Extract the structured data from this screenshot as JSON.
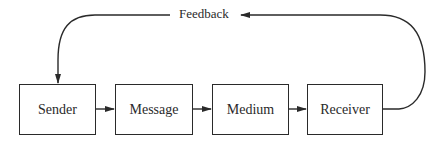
{
  "diagram": {
    "type": "communication-process-flow",
    "nodes": [
      {
        "id": "sender",
        "label": "Sender"
      },
      {
        "id": "message",
        "label": "Message"
      },
      {
        "id": "medium",
        "label": "Medium"
      },
      {
        "id": "receiver",
        "label": "Receiver"
      }
    ],
    "edges": [
      {
        "from": "sender",
        "to": "message"
      },
      {
        "from": "message",
        "to": "medium"
      },
      {
        "from": "medium",
        "to": "receiver"
      },
      {
        "from": "receiver",
        "to": "sender",
        "label": "Feedback"
      }
    ],
    "feedback_label": "Feedback"
  }
}
